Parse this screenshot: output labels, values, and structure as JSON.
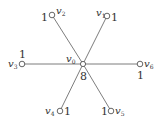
{
  "diagram": {
    "type": "star-graph",
    "colors": {
      "edge": "#6e6e6e",
      "node_stroke": "#555555",
      "node_fill": "#ffffff",
      "text": "#333333"
    },
    "center": {
      "id": "v0",
      "label": "v",
      "sub": "0",
      "weight": "8",
      "x": 83,
      "y": 64
    },
    "nodes": [
      {
        "id": "v1",
        "label": "v",
        "sub": "1",
        "weight": "1",
        "x": 107,
        "y": 16
      },
      {
        "id": "v2",
        "label": "v",
        "sub": "2",
        "weight": "1",
        "x": 52,
        "y": 15
      },
      {
        "id": "v3",
        "label": "v",
        "sub": "3",
        "weight": "1",
        "x": 22,
        "y": 64
      },
      {
        "id": "v4",
        "label": "v",
        "sub": "4",
        "weight": "1",
        "x": 60,
        "y": 111
      },
      {
        "id": "v5",
        "label": "v",
        "sub": "5",
        "weight": "1",
        "x": 111,
        "y": 111
      },
      {
        "id": "v6",
        "label": "v",
        "sub": "6",
        "weight": "1",
        "x": 140,
        "y": 64
      }
    ],
    "edges": [
      [
        "v0",
        "v1"
      ],
      [
        "v0",
        "v2"
      ],
      [
        "v0",
        "v3"
      ],
      [
        "v0",
        "v4"
      ],
      [
        "v0",
        "v5"
      ],
      [
        "v0",
        "v6"
      ]
    ]
  }
}
